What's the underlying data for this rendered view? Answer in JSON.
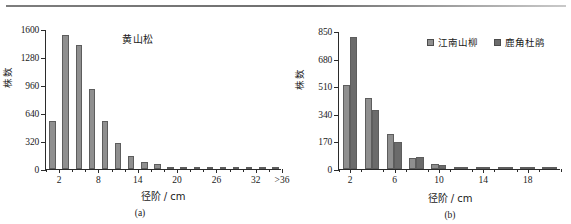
{
  "figure": {
    "divider": "horizontal-rule"
  },
  "panel_a": {
    "caption": "(a)",
    "title": "黄山松",
    "ylabel": "株数",
    "xlabel": "径阶 / cm"
  },
  "panel_b": {
    "caption": "(b)",
    "ylabel": "株数",
    "xlabel": "径阶 / cm",
    "legend": [
      {
        "label": "江南山柳",
        "color": "#8f8f8f"
      },
      {
        "label": "鹿角杜鹃",
        "color": "#6b6b6b"
      }
    ]
  },
  "chart_data": [
    {
      "type": "bar",
      "title": "黄山松",
      "subtitle": "(a)",
      "xlabel": "径阶 / cm",
      "ylabel": "株数",
      "ylim": [
        0,
        1600
      ],
      "yticks": [
        0,
        320,
        640,
        960,
        1280,
        1600
      ],
      "ytick_labels": [
        "0",
        "320",
        "640",
        "960",
        "1280",
        "1600"
      ],
      "xticks": [
        2,
        8,
        14,
        20,
        26,
        32,
        36
      ],
      "xtick_labels": [
        "2",
        "8",
        "14",
        "20",
        "26",
        "32",
        ">36"
      ],
      "grid": false,
      "legend": null,
      "categories": [
        2,
        4,
        6,
        8,
        10,
        12,
        14,
        16,
        18,
        20,
        22,
        24,
        26,
        28,
        30,
        32,
        34,
        36
      ],
      "values": [
        545,
        1530,
        1420,
        910,
        545,
        295,
        150,
        85,
        55,
        28,
        18,
        12,
        10,
        8,
        8,
        7,
        6,
        5
      ],
      "series": [
        {
          "name": "黄山松",
          "color": "#8f8f8f",
          "values": [
            545,
            1530,
            1420,
            910,
            545,
            295,
            150,
            85,
            55,
            28,
            18,
            12,
            10,
            8,
            8,
            7,
            6,
            5
          ]
        }
      ]
    },
    {
      "type": "bar",
      "title": "",
      "subtitle": "(b)",
      "xlabel": "径阶 / cm",
      "ylabel": "株数",
      "ylim": [
        0,
        850
      ],
      "yticks": [
        0,
        170,
        340,
        510,
        680,
        850
      ],
      "ytick_labels": [
        "0",
        "170",
        "340",
        "510",
        "680",
        "850"
      ],
      "xticks": [
        2,
        6,
        10,
        14,
        18
      ],
      "xtick_labels": [
        "2",
        "6",
        "10",
        "14",
        "18"
      ],
      "grid": false,
      "legend_position": "top-right",
      "categories": [
        2,
        4,
        6,
        8,
        10,
        12,
        14,
        16,
        18,
        20
      ],
      "series": [
        {
          "name": "江南山柳",
          "color": "#8f8f8f",
          "values": [
            515,
            440,
            215,
            70,
            28,
            12,
            6,
            5,
            5,
            4
          ]
        },
        {
          "name": "鹿角杜鹃",
          "color": "#6b6b6b",
          "values": [
            815,
            365,
            168,
            72,
            22,
            10,
            5,
            5,
            5,
            4
          ]
        }
      ]
    }
  ]
}
